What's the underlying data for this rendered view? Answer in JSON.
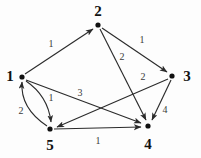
{
  "figure": {
    "type": "directed-weighted-graph",
    "width": 201,
    "height": 158,
    "background_color": "#fdfdfd",
    "node_color": "#111111",
    "edge_color": "#2b2b2b",
    "label_color": "#111111"
  },
  "nodes": [
    {
      "id": "1",
      "label": "1",
      "x": 22,
      "y": 77,
      "label_x": 10,
      "label_y": 76
    },
    {
      "id": "2",
      "label": "2",
      "x": 98,
      "y": 25,
      "label_x": 98,
      "label_y": 11
    },
    {
      "id": "3",
      "label": "3",
      "x": 172,
      "y": 76,
      "label_x": 187,
      "label_y": 76
    },
    {
      "id": "4",
      "label": "4",
      "x": 148,
      "y": 126,
      "label_x": 148,
      "label_y": 144
    },
    {
      "id": "5",
      "label": "5",
      "x": 50,
      "y": 129,
      "label_x": 50,
      "label_y": 145
    }
  ],
  "edges": [
    {
      "id": "e-1-2",
      "from": "1",
      "to": "2",
      "weight": "1",
      "label_x": 51,
      "label_y": 44,
      "shape": "straight"
    },
    {
      "id": "e-2-3",
      "from": "2",
      "to": "3",
      "weight": "1",
      "label_x": 142,
      "label_y": 40,
      "shape": "straight"
    },
    {
      "id": "e-2-4",
      "from": "2",
      "to": "4",
      "weight": "2",
      "label_x": 122,
      "label_y": 57,
      "shape": "straight"
    },
    {
      "id": "e-3-5",
      "from": "3",
      "to": "5",
      "weight": "2",
      "label_x": 143,
      "label_y": 77,
      "shape": "straight"
    },
    {
      "id": "e-3-4",
      "from": "3",
      "to": "4",
      "weight": "4",
      "label_x": 165,
      "label_y": 110,
      "shape": "straight"
    },
    {
      "id": "e-1-4",
      "from": "1",
      "to": "4",
      "weight": "3",
      "label_x": 80,
      "label_y": 93,
      "shape": "straight"
    },
    {
      "id": "e-5-4",
      "from": "5",
      "to": "4",
      "weight": "1",
      "label_x": 98,
      "label_y": 141,
      "shape": "straight"
    },
    {
      "id": "e-1-5",
      "from": "1",
      "to": "5",
      "weight": "1",
      "label_x": 51,
      "label_y": 98,
      "shape": "curved-right"
    },
    {
      "id": "e-5-1",
      "from": "5",
      "to": "1",
      "weight": "2",
      "label_x": 21,
      "label_y": 111,
      "shape": "curved-left"
    }
  ]
}
